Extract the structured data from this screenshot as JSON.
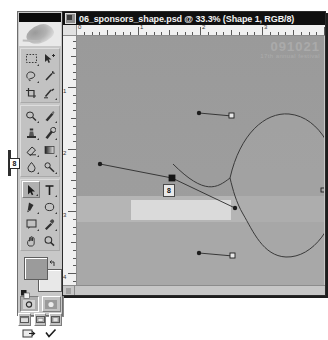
{
  "app": {
    "name": "Adobe Photoshop",
    "toolbox_title": "toolbox-title-bar"
  },
  "document": {
    "title": "06_sponsors_shape.psd @ 33.3% (Shape 1, RGB/8)",
    "file_name": "06_sponsors_shape.psd",
    "zoom": "33.3%",
    "layer": "Shape 1",
    "color_mode": "RGB/8",
    "icon": "photoshop-document-icon"
  },
  "rulers": {
    "unit": "inches",
    "horizontal_labels": [
      "0",
      "1",
      "2",
      "3",
      "4"
    ],
    "vertical_labels": [
      "0",
      "1",
      "2",
      "3",
      "4"
    ]
  },
  "canvas": {
    "watermark_line1": "091021",
    "watermark_line2": "17th annual festival",
    "background_color": "#9c9c9c",
    "band_color": "#b5b5b5",
    "highlight_color": "#dedede"
  },
  "callouts": [
    {
      "id": "8",
      "location": "toolbox-path-selection-tool"
    },
    {
      "id": "8",
      "location": "canvas-selected-anchor-point"
    }
  ],
  "toolbox": {
    "sections": [
      {
        "name": "selection-tools",
        "tools": [
          {
            "name": "marquee-tool",
            "icon": "marquee-icon",
            "selected": false,
            "has_flyout": true
          },
          {
            "name": "move-tool",
            "icon": "move-icon",
            "selected": false,
            "has_flyout": false
          },
          {
            "name": "lasso-tool",
            "icon": "lasso-icon",
            "selected": false,
            "has_flyout": true
          },
          {
            "name": "magic-wand-tool",
            "icon": "magic-wand-icon",
            "selected": false,
            "has_flyout": false
          },
          {
            "name": "crop-tool",
            "icon": "crop-icon",
            "selected": false,
            "has_flyout": false
          },
          {
            "name": "slice-tool",
            "icon": "slice-icon",
            "selected": false,
            "has_flyout": true
          }
        ]
      },
      {
        "name": "retouch-paint-tools",
        "tools": [
          {
            "name": "healing-brush-tool",
            "icon": "healing-brush-icon",
            "selected": false,
            "has_flyout": true
          },
          {
            "name": "brush-tool",
            "icon": "brush-icon",
            "selected": false,
            "has_flyout": true
          },
          {
            "name": "clone-stamp-tool",
            "icon": "clone-stamp-icon",
            "selected": false,
            "has_flyout": true
          },
          {
            "name": "history-brush-tool",
            "icon": "history-brush-icon",
            "selected": false,
            "has_flyout": true
          },
          {
            "name": "eraser-tool",
            "icon": "eraser-icon",
            "selected": false,
            "has_flyout": true
          },
          {
            "name": "gradient-tool",
            "icon": "gradient-icon",
            "selected": false,
            "has_flyout": true
          },
          {
            "name": "blur-tool",
            "icon": "blur-drop-icon",
            "selected": false,
            "has_flyout": true
          },
          {
            "name": "dodge-tool",
            "icon": "dodge-icon",
            "selected": false,
            "has_flyout": true
          }
        ]
      },
      {
        "name": "vector-type-tools",
        "tools": [
          {
            "name": "path-selection-tool",
            "icon": "black-arrow-icon",
            "selected": true,
            "has_flyout": true
          },
          {
            "name": "type-tool",
            "icon": "type-t-icon",
            "selected": false,
            "has_flyout": true
          },
          {
            "name": "pen-tool",
            "icon": "pen-icon",
            "selected": false,
            "has_flyout": true
          },
          {
            "name": "shape-tool",
            "icon": "ellipse-shape-icon",
            "selected": false,
            "has_flyout": true
          },
          {
            "name": "notes-tool",
            "icon": "notes-icon",
            "selected": false,
            "has_flyout": true
          },
          {
            "name": "eyedropper-tool",
            "icon": "eyedropper-icon",
            "selected": false,
            "has_flyout": true
          },
          {
            "name": "hand-tool",
            "icon": "hand-icon",
            "selected": false,
            "has_flyout": false
          },
          {
            "name": "zoom-tool",
            "icon": "magnifier-icon",
            "selected": false,
            "has_flyout": false
          }
        ]
      }
    ],
    "colors": {
      "foreground": "#9b9b9b",
      "background": "#e8e8e8",
      "swap_icon": "swap-colors-icon",
      "default_icon": "default-colors-icon"
    },
    "mask_buttons": [
      {
        "name": "standard-mode-button",
        "icon": "standard-mode-icon",
        "active": true
      },
      {
        "name": "quick-mask-mode-button",
        "icon": "quick-mask-icon",
        "active": false
      }
    ],
    "screen_buttons": [
      {
        "name": "standard-screen-button",
        "icon": "screen-standard-icon"
      },
      {
        "name": "full-screen-menubar-button",
        "icon": "screen-menubar-icon"
      },
      {
        "name": "full-screen-button",
        "icon": "screen-full-icon"
      }
    ],
    "jump_button": {
      "name": "jump-to-imageready-button",
      "icon": "imageready-icon"
    }
  },
  "path": {
    "tool_active": "path-selection-tool",
    "anchor_points": [
      {
        "id": "top-anchor",
        "x": 216,
        "y": 104,
        "type": "smooth",
        "selected": false
      },
      {
        "id": "right-anchor",
        "x": 268,
        "y": 178,
        "type": "smooth",
        "selected": false
      },
      {
        "id": "bottom-anchor",
        "x": 218,
        "y": 243,
        "type": "smooth",
        "selected": false
      },
      {
        "id": "corner-anchor",
        "x": 157,
        "y": 166,
        "type": "corner",
        "selected": true
      }
    ],
    "direction_handles": [
      {
        "from": "top-anchor",
        "x": 184,
        "y": 101
      },
      {
        "from": "bottom-anchor",
        "x": 183,
        "y": 240
      },
      {
        "from": "corner-anchor",
        "x": 219,
        "y": 195
      },
      {
        "from": "corner-anchor",
        "x": 85,
        "y": 152
      }
    ]
  }
}
